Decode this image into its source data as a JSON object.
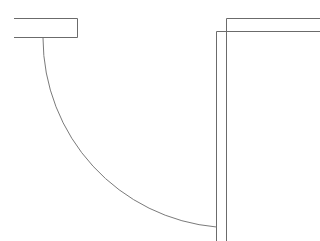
{
  "drawing": {
    "title": "Door Swing Detail",
    "background_color": "#ffffff",
    "line_color": "#6b6b6b",
    "arc_color": "#7a7a7a",
    "line_width": 1,
    "canvas": {
      "width": 320,
      "height": 241
    },
    "elements": {
      "left_wall": {
        "label": "Left Wall Segment",
        "type": "open-rectangle",
        "x1": 14,
        "y1": 18,
        "x2": 78,
        "y2": 38,
        "open_side": "left",
        "path": "M 14 18.5 L 77.5 18.5 L 77.5 37.5 L 14 37.5"
      },
      "right_wall_outer": {
        "label": "Right Wall Outer Face",
        "type": "polyline",
        "path": "M 216.5 241 L 216.5 31.5 L 320 31.5"
      },
      "right_wall_inner": {
        "label": "Right Wall Inner Face",
        "type": "polyline",
        "path": "M 226.5 241 L 226.5 18.5 L 320 18.5"
      },
      "door_swing_arc": {
        "label": "Door Swing Arc",
        "type": "arc",
        "start_x": 43,
        "start_y": 38,
        "end_x": 216,
        "end_y": 227,
        "radius": 190,
        "sweep": "quarter-circle",
        "path": "M 43 38 A 190 190 0 0 0 216.5 227"
      },
      "door_leaf": {
        "label": "Door Leaf",
        "type": "line",
        "x1": 43,
        "y1": 38,
        "x2": 43,
        "y2": 38
      }
    }
  }
}
